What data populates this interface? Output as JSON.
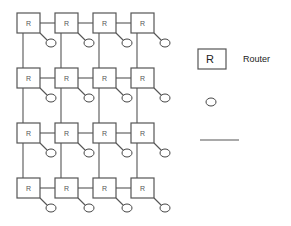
{
  "diagram": {
    "type": "mesh-network",
    "rows": 4,
    "cols": 4,
    "router_label": "R",
    "stroke_color": "#555555"
  },
  "legend": {
    "router": {
      "symbol_label": "R",
      "text": "Router"
    },
    "node": {
      "symbol": "circle",
      "text": ""
    },
    "link": {
      "symbol": "line",
      "text": ""
    }
  }
}
